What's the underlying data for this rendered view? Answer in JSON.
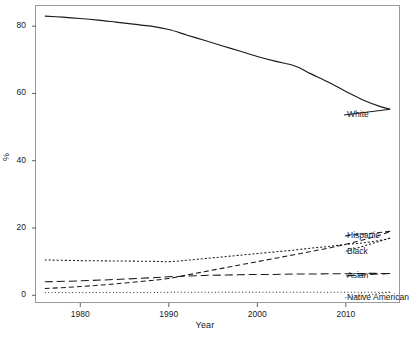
{
  "chart_data": {
    "type": "line",
    "title": "",
    "xlabel": "Year",
    "ylabel": "%",
    "xlim": [
      1975,
      2016
    ],
    "ylim": [
      -2,
      86
    ],
    "grid": false,
    "legend_position": "right-inline-labels",
    "xticks": [
      1980,
      1990,
      2000,
      2010
    ],
    "xtick_labels": [
      "1980",
      "1990",
      "2000",
      "2010"
    ],
    "yticks": [
      0,
      20,
      40,
      60,
      80
    ],
    "ytick_labels": [
      "0",
      "20",
      "40",
      "60",
      "80"
    ],
    "series": [
      {
        "name": "White",
        "label": "White",
        "linestyle": "solid",
        "color": "#1a1a1a",
        "x": [
          1976,
          1978,
          1980,
          1982,
          1984,
          1986,
          1988,
          1990,
          1992,
          1994,
          1996,
          1998,
          2000,
          2002,
          2004,
          2005,
          2006,
          2008,
          2010,
          2012,
          2014,
          2015
        ],
        "values": [
          83.0,
          82.7,
          82.3,
          81.8,
          81.2,
          80.6,
          80.0,
          79.0,
          77.4,
          75.8,
          74.2,
          72.6,
          71.0,
          69.6,
          68.4,
          67.3,
          65.9,
          63.4,
          60.6,
          58.0,
          56.0,
          55.3
        ]
      },
      {
        "name": "Hispanic",
        "label": "Hispanic",
        "linestyle": "dashed",
        "color": "#1a1a1a",
        "x": [
          1976,
          1980,
          1984,
          1988,
          1990,
          1992,
          1994,
          1996,
          1998,
          2000,
          2002,
          2004,
          2006,
          2008,
          2010,
          2012,
          2014,
          2015
        ],
        "values": [
          2.0,
          2.6,
          3.4,
          4.4,
          5.0,
          6.0,
          7.0,
          8.0,
          9.0,
          10.0,
          11.0,
          12.0,
          13.0,
          14.0,
          15.2,
          16.5,
          18.0,
          19.0
        ]
      },
      {
        "name": "Black",
        "label": "Black",
        "linestyle": "dotted",
        "color": "#1a1a1a",
        "x": [
          1976,
          1980,
          1984,
          1988,
          1990,
          1992,
          1994,
          1996,
          1998,
          2000,
          2002,
          2004,
          2006,
          2008,
          2010,
          2012,
          2014,
          2015
        ],
        "values": [
          10.5,
          10.3,
          10.2,
          10.1,
          10.0,
          10.4,
          10.9,
          11.4,
          11.9,
          12.4,
          12.9,
          13.4,
          14.0,
          14.5,
          15.1,
          15.6,
          16.4,
          17.0
        ]
      },
      {
        "name": "Asian",
        "label": "Asian",
        "linestyle": "longdash",
        "color": "#1a1a1a",
        "x": [
          1976,
          1980,
          1984,
          1988,
          1990,
          1992,
          1994,
          1996,
          1998,
          2000,
          2002,
          2004,
          2006,
          2008,
          2010,
          2012,
          2014,
          2015
        ],
        "values": [
          4.0,
          4.3,
          4.7,
          5.2,
          5.5,
          5.7,
          5.9,
          6.0,
          6.1,
          6.2,
          6.2,
          6.3,
          6.3,
          6.4,
          6.4,
          6.5,
          6.5,
          6.5
        ]
      },
      {
        "name": "Native American",
        "label": "Native American",
        "linestyle": "finedotted",
        "color": "#1a1a1a",
        "x": [
          1976,
          1980,
          1984,
          1988,
          1990,
          1992,
          1994,
          1996,
          1998,
          2000,
          2002,
          2004,
          2006,
          2008,
          2010,
          2012,
          2014,
          2015
        ],
        "values": [
          0.8,
          0.8,
          0.8,
          0.8,
          0.9,
          0.9,
          0.9,
          0.9,
          0.9,
          0.9,
          0.9,
          0.9,
          0.9,
          0.9,
          0.9,
          0.9,
          0.9,
          0.9
        ]
      }
    ]
  },
  "panel": {
    "border_color": "#9a9a9a",
    "background": "#ffffff"
  }
}
